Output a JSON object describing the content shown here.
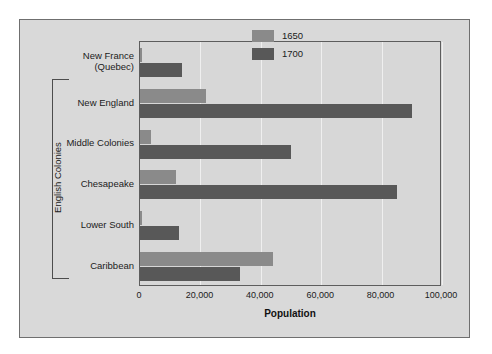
{
  "chart_data": {
    "type": "bar",
    "orientation": "horizontal",
    "title": "",
    "xlabel": "Population",
    "ylabel": "",
    "xlim": [
      0,
      100000
    ],
    "xticks": [
      0,
      20000,
      40000,
      60000,
      80000,
      100000
    ],
    "xtick_labels": [
      "0",
      "20,000",
      "40,000",
      "60,000",
      "80,000",
      "100,000"
    ],
    "grid": true,
    "grid_axis": "x",
    "legend_position": "top-right",
    "categories": [
      "New France\n(Quebec)",
      "New England",
      "Middle Colonies",
      "Chesapeake",
      "Lower South",
      "Caribbean"
    ],
    "category_labels": [
      [
        "New France",
        "(Quebec)"
      ],
      [
        "New England"
      ],
      [
        "Middle Colonies"
      ],
      [
        "Chesapeake"
      ],
      [
        "Lower South"
      ],
      [
        "Caribbean"
      ]
    ],
    "series": [
      {
        "name": "1650",
        "color": "#8a8a8a",
        "values": [
          500,
          22000,
          3500,
          12000,
          500,
          44000
        ]
      },
      {
        "name": "1700",
        "color": "#585858",
        "values": [
          14000,
          90000,
          50000,
          85000,
          13000,
          33000
        ]
      }
    ],
    "annotations": [
      {
        "text": "English Colonies",
        "type": "group-bracket",
        "covers": [
          "New England",
          "Middle Colonies",
          "Chesapeake",
          "Lower South",
          "Caribbean"
        ]
      }
    ]
  },
  "legend": {
    "items": [
      {
        "label": "1650",
        "color": "#8a8a8a"
      },
      {
        "label": "1700",
        "color": "#585858"
      }
    ]
  },
  "axis": {
    "x_title": "Population"
  },
  "bracket": {
    "label": "English Colonies"
  },
  "colors": {
    "figure_background": "#d9d9d9",
    "plot_background": "#d7d7d7",
    "frame": "#5d5d5d",
    "gridline": "#efefef",
    "text": "#1b1b1b",
    "series_1650": "#8a8a8a",
    "series_1700": "#585858"
  }
}
